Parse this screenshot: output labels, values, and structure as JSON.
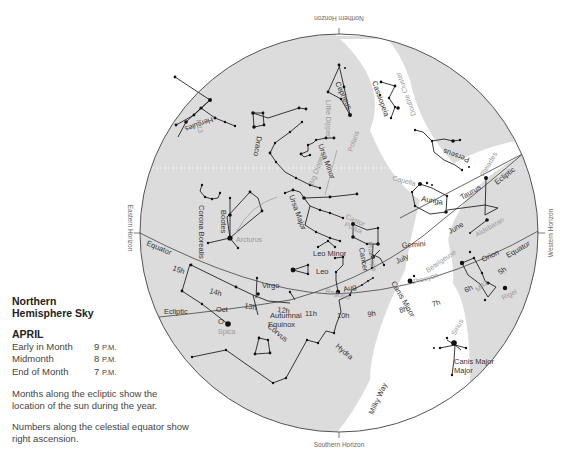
{
  "legend": {
    "title_line1": "Northern",
    "title_line2": "Hemisphere Sky",
    "month": "APRIL",
    "times": [
      {
        "label": "Early in Month",
        "hour": "9",
        "suffix": "P.M."
      },
      {
        "label": "Midmonth",
        "hour": "8",
        "suffix": "P.M."
      },
      {
        "label": "End of Month",
        "hour": "7",
        "suffix": "P.M."
      }
    ],
    "note1": "Months along the ecliptic show the location of the sun during the year.",
    "note2": "Numbers along the celestial equator show right ascension."
  },
  "horizons": {
    "north": "Northern Horizon",
    "south": "Southern Horizon",
    "east": "Eastern Horizon",
    "west": "Western Horizon"
  },
  "lines": {
    "equator": "Equator",
    "ecliptic": "Ecliptic",
    "equator_right": "Equator",
    "ecliptic_right": "Ecliptic",
    "autumnal_equinox_1": "Autumnal",
    "autumnal_equinox_2": "Equinox",
    "milky_way": "Milky Way"
  },
  "right_ascension": [
    "15h",
    "14h",
    "13h",
    "12h",
    "11h",
    "10h",
    "9h",
    "8h",
    "7h",
    "6h",
    "5h"
  ],
  "ecliptic_months": [
    "Oct",
    "Aug",
    "July",
    "June"
  ],
  "constellations": [
    "Hercules",
    "Draco",
    "Cepheus",
    "Cassiopeia",
    "Perseus",
    "Little Dipper",
    "Ursa Minor",
    "Big Dipper",
    "Ursa Major",
    "Corona Borealis",
    "Bootes",
    "Leo Minor",
    "Leo",
    "Cancer",
    "Gemini",
    "Auriga",
    "Taurus",
    "Orion",
    "Canis Minor",
    "Canis Major",
    "Virgo",
    "Corvus",
    "Hydra"
  ],
  "stars": {
    "arcturus": "Arcturus",
    "spica": "Spica",
    "regulus": "Regulus",
    "procyon": "Procyon",
    "castor": "Castor",
    "pollux": "Pollux",
    "capella": "Capella",
    "aldebaran": "Aldebaran",
    "betelgeuse": "Betelgeuse",
    "rigel": "Rigel",
    "sirius": "Sirius",
    "pleiades": "Pleiades",
    "polaris": "Polaris",
    "m42": "M42",
    "praesepe": "Praesepe",
    "double_cluster": "Double Cluster",
    "vega": "Vega",
    "m13": "M13"
  },
  "sun_marker": "O",
  "colors": {
    "sky_gray": "#dcdcdc",
    "milky_way": "#ffffff",
    "line": "#444444",
    "label_gray": "#999999"
  }
}
